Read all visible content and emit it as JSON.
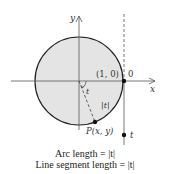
{
  "diagram": {
    "colors": {
      "circle_fill": "#e4e4e4",
      "stroke": "#222222"
    },
    "axes": {
      "x_label": "x",
      "y_label": "y"
    },
    "labels": {
      "point_1_0": "(1, 0)",
      "origin_t": "0",
      "angle": "t",
      "arc": "|t|",
      "point_p": "P(x, y)",
      "line_t": "t"
    },
    "caption": {
      "line1": "Arc length = |t|",
      "line2": "Line segment length = |t|"
    }
  }
}
